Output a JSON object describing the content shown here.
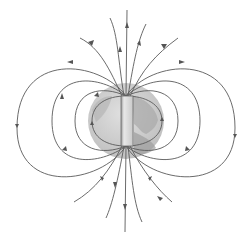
{
  "diagram": {
    "colors": {
      "background": "#ffffff",
      "field_line": "#5a5a5a",
      "globe_ocean": "#c8c8c8",
      "globe_land": "#a9a9a9",
      "magnet": "#d6d6d6",
      "magnet_edge": "#6a6a6a"
    },
    "labels": []
  }
}
